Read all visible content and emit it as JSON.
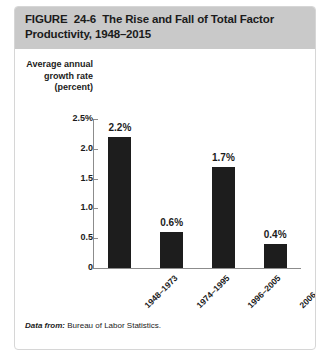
{
  "figure": {
    "number_label": "FIGURE  24-6",
    "title": "The Rise and Fall of Total Factor Productivity, 1948–2015",
    "title_line1": "FIGURE  24-6  The Rise and Fall of Total Factor",
    "title_line2": "Productivity, 1948–2015"
  },
  "axis": {
    "y_title_line1": "Average annual",
    "y_title_line2": "growth rate",
    "y_title_line3": "(percent)"
  },
  "source": {
    "lead": "Data from:",
    "text": "Bureau of Labor Statistics."
  },
  "colors": {
    "header_background": "#c9c9c9",
    "bar": "#1d1d1d",
    "axis": "#8c8c8c",
    "border": "#d6d6d6",
    "text": "#1b1b1b"
  },
  "chart_data": {
    "type": "bar",
    "title": "The Rise and Fall of Total Factor Productivity, 1948–2015",
    "xlabel": "",
    "ylabel": "Average annual growth rate (percent)",
    "categories": [
      "1948–1973",
      "1974–1995",
      "1996–2005",
      "2006–2015"
    ],
    "values": [
      2.2,
      0.6,
      1.7,
      0.4
    ],
    "value_labels": [
      "2.2%",
      "0.6%",
      "1.7%",
      "0.4%"
    ],
    "ylim": [
      0,
      2.5
    ],
    "yticks": [
      0,
      0.5,
      1.0,
      1.5,
      2.0,
      2.5
    ],
    "ytick_labels": [
      "0",
      "0.5",
      "1.0",
      "1.5",
      "2.0",
      "2.5%"
    ],
    "grid": false,
    "legend": false
  }
}
